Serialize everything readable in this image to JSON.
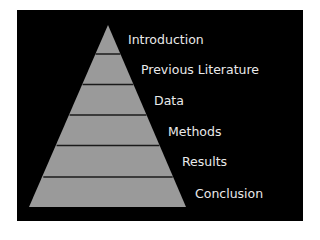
{
  "diagram": {
    "type": "pyramid",
    "colors": {
      "background": "#000000",
      "tier_fill": "#9a9a9a",
      "divider": "#1a1a1a",
      "label": "#eaeaea"
    },
    "tiers": [
      {
        "label": "Introduction"
      },
      {
        "label": "Previous Literature"
      },
      {
        "label": "Data"
      },
      {
        "label": "Methods"
      },
      {
        "label": "Results"
      },
      {
        "label": "Conclusion"
      }
    ]
  }
}
